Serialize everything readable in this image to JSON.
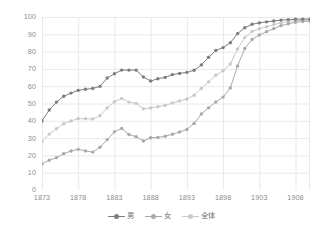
{
  "chart_data": {
    "type": "line",
    "title": "",
    "subtitle": "",
    "xlabel": "",
    "ylabel": "",
    "grid": true,
    "legend_position": "bottom",
    "xlim": [
      1873,
      1910
    ],
    "ylim": [
      0,
      100
    ],
    "y_ticks": [
      0,
      10,
      20,
      30,
      40,
      50,
      60,
      70,
      80,
      90,
      100
    ],
    "y_tick_labels": [
      "0",
      "10",
      "20",
      "30",
      "40",
      "50",
      "60",
      "70",
      "80",
      "90",
      "100"
    ],
    "x_ticks": [
      1873,
      1878,
      1883,
      1888,
      1893,
      1898,
      1903,
      1908
    ],
    "x_tick_labels": [
      "1873",
      "1878",
      "1883",
      "1888",
      "1893",
      "1898",
      "1903",
      "1908"
    ],
    "x": [
      1873,
      1874,
      1875,
      1876,
      1877,
      1878,
      1879,
      1880,
      1881,
      1882,
      1883,
      1884,
      1885,
      1886,
      1887,
      1888,
      1889,
      1890,
      1891,
      1892,
      1893,
      1894,
      1895,
      1896,
      1897,
      1898,
      1899,
      1900,
      1901,
      1902,
      1903,
      1904,
      1905,
      1906,
      1907,
      1908,
      1909,
      1910
    ],
    "series": [
      {
        "name": "男",
        "color": "#7d7d7d",
        "marker": "circle",
        "values": [
          39.9,
          46.2,
          50.8,
          54.2,
          56.0,
          57.6,
          58.2,
          58.7,
          59.9,
          64.7,
          67.2,
          69.3,
          69.3,
          69.3,
          65.3,
          63.0,
          64.3,
          65.1,
          66.7,
          67.4,
          68.0,
          69.2,
          72.3,
          76.7,
          80.7,
          82.3,
          85.1,
          90.4,
          93.8,
          95.8,
          96.6,
          97.2,
          97.7,
          98.2,
          98.5,
          98.7,
          98.8,
          98.8
        ]
      },
      {
        "name": "女",
        "color": "#a9a9a9",
        "marker": "circle",
        "values": [
          15.1,
          17.2,
          18.7,
          21.0,
          22.5,
          23.5,
          22.6,
          21.9,
          24.7,
          29.1,
          33.6,
          35.6,
          32.1,
          30.8,
          28.3,
          30.2,
          30.4,
          31.1,
          32.2,
          33.5,
          35.0,
          38.5,
          43.9,
          47.5,
          50.9,
          53.7,
          59.0,
          71.7,
          81.8,
          87.0,
          89.6,
          91.5,
          93.3,
          95.0,
          96.1,
          97.0,
          97.4,
          97.6
        ]
      },
      {
        "name": "全体",
        "color": "#c9c9c9",
        "marker": "circle",
        "values": [
          28.1,
          32.3,
          35.4,
          38.3,
          39.9,
          41.3,
          41.2,
          41.1,
          42.9,
          47.4,
          51.0,
          52.9,
          50.8,
          50.1,
          46.9,
          47.4,
          48.2,
          48.9,
          50.3,
          51.5,
          52.6,
          54.8,
          58.7,
          62.5,
          66.3,
          68.9,
          72.8,
          81.5,
          88.1,
          91.6,
          93.2,
          94.4,
          95.6,
          96.6,
          97.4,
          97.9,
          98.1,
          98.2
        ]
      }
    ],
    "colors": {
      "grid": "#e8e8ee",
      "axis_text": "#8c8c8c",
      "legend_text": "#6e6e6e",
      "background": "#ffffff"
    }
  }
}
